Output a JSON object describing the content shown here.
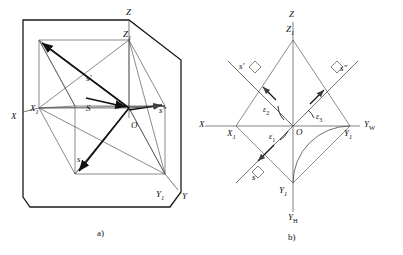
{
  "figure": {
    "background_color": "#ffffff",
    "line_color": "#3c3c3c",
    "bold_line_color": "#1a1a1a",
    "text_color": "#111111"
  },
  "panel_a": {
    "caption": "a)",
    "labels": {
      "axis_x": "X",
      "axis_x1": "X",
      "axis_x1_sub": "1",
      "axis_y": "Y",
      "axis_y1": "Y",
      "axis_y1_sub": "1",
      "axis_z": "Z",
      "axis_z1": "Z",
      "axis_z1_sub": "1",
      "origin": "O",
      "vector_s_capital": "S",
      "vector_s_prime": "s'",
      "vector_s_double_prime": "s″",
      "vector_s": "s"
    }
  },
  "panel_b": {
    "caption": "b)",
    "labels": {
      "axis_x": "X",
      "axis_x1": "X",
      "axis_x1_sub": "1",
      "axis_y1_right": "Y",
      "axis_y1_right_sub": "1",
      "axis_y1_bottom": "Y",
      "axis_y1_bottom_sub": "1",
      "axis_yw": "Y",
      "axis_yw_sub": "W",
      "axis_yh": "Y",
      "axis_yh_sub": "H",
      "axis_z": "Z",
      "axis_z1": "Z",
      "axis_z1_sub": "1",
      "origin": "O",
      "vector_s_prime": "s'",
      "vector_s_double_prime": "s″",
      "vector_s": "s",
      "angle_1": "ε",
      "angle_1_sub": "1",
      "angle_2": "ε",
      "angle_2_sub": "2",
      "angle_3": "ε",
      "angle_3_sub": "3"
    }
  }
}
